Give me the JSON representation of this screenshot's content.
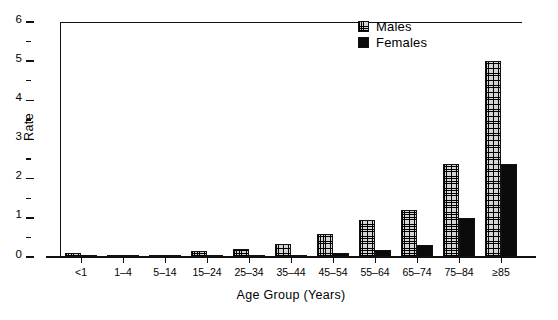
{
  "chart_data": {
    "type": "bar",
    "title": "",
    "xlabel": "Age Group (Years)",
    "ylabel": "Rate",
    "categories": [
      "<1",
      "1–4",
      "5–14",
      "15–24",
      "25–34",
      "35–44",
      "45–54",
      "55–64",
      "65–74",
      "75–84",
      "≥85"
    ],
    "series": [
      {
        "name": "Males",
        "values": [
          0.1,
          0.02,
          0.02,
          0.15,
          0.2,
          0.32,
          0.6,
          0.95,
          1.2,
          2.37,
          5.0
        ]
      },
      {
        "name": "Females",
        "values": [
          0.05,
          0.01,
          0.01,
          0.03,
          0.04,
          0.06,
          0.09,
          0.17,
          0.3,
          1.0,
          2.38
        ]
      }
    ],
    "ylim": [
      0,
      6
    ],
    "yticks": [
      0,
      1,
      2,
      3,
      4,
      5,
      6
    ],
    "ytick_labels": [
      "0",
      "1",
      "2",
      "3",
      "4",
      "5",
      "6"
    ],
    "yminor_ticks": [
      0.5,
      1.5,
      2.5,
      3.5,
      4.5,
      5.5
    ],
    "grid": false,
    "legend_position": "top-right",
    "colors": {
      "males": "#d4d4d4",
      "females": "#0a0a0a",
      "axis": "#111111",
      "background": "#ffffff"
    }
  },
  "legend": {
    "entries": [
      {
        "label": "Males",
        "swatch": "crosshatch-pattern-swatch"
      },
      {
        "label": "Females",
        "swatch": "solid-black-swatch"
      }
    ]
  }
}
